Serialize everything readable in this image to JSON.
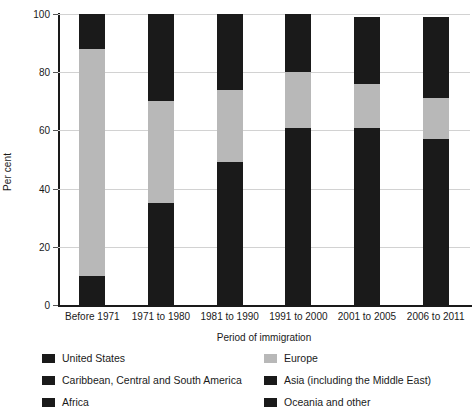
{
  "chart_data": {
    "type": "bar",
    "subtype": "stacked-percentage-column",
    "title": "",
    "xlabel": "Period of immigration",
    "ylabel": "Per cent",
    "ylim": [
      0,
      100
    ],
    "yticks": [
      0,
      20,
      40,
      60,
      80,
      100
    ],
    "grid": true,
    "legend_position": "bottom",
    "categories": [
      "Before 1971",
      "1971 to 1980",
      "1981 to 1990",
      "1991 to 2000",
      "2001 to 2005",
      "2006 to 2011"
    ],
    "series": [
      {
        "name": "United States",
        "color": "#1a1a1a",
        "values": [
          4,
          5,
          4,
          3,
          3,
          3
        ]
      },
      {
        "name": "Caribbean, Central and South America",
        "color": "#1a1a1a",
        "values": [
          6,
          30,
          45,
          58,
          58,
          54
        ]
      },
      {
        "name": "Europe",
        "color": "#b8b8b8",
        "values": [
          78,
          35,
          25,
          19,
          15,
          14
        ]
      },
      {
        "name": "Asia (including the Middle East)",
        "color": "#1a1a1a",
        "values": [
          12,
          30,
          26,
          20,
          23,
          28
        ]
      },
      {
        "name": "Africa",
        "color": "#1a1a1a",
        "values": [
          0,
          0,
          0,
          0,
          0,
          0
        ]
      },
      {
        "name": "Oceania and other",
        "color": "#1a1a1a",
        "values": [
          0,
          0,
          0,
          0,
          0,
          0
        ]
      }
    ],
    "rendered_segments": [
      {
        "category": "Before 1971",
        "segments": [
          {
            "from": 0,
            "to": 10,
            "color": "#1a1a1a"
          },
          {
            "from": 10,
            "to": 88,
            "color": "#b8b8b8"
          },
          {
            "from": 88,
            "to": 100,
            "color": "#1a1a1a"
          }
        ]
      },
      {
        "category": "1971 to 1980",
        "segments": [
          {
            "from": 0,
            "to": 35,
            "color": "#1a1a1a"
          },
          {
            "from": 35,
            "to": 70,
            "color": "#b8b8b8"
          },
          {
            "from": 70,
            "to": 100,
            "color": "#1a1a1a"
          }
        ]
      },
      {
        "category": "1981 to 1990",
        "segments": [
          {
            "from": 0,
            "to": 49,
            "color": "#1a1a1a"
          },
          {
            "from": 49,
            "to": 74,
            "color": "#b8b8b8"
          },
          {
            "from": 74,
            "to": 100,
            "color": "#1a1a1a"
          }
        ]
      },
      {
        "category": "1991 to 2000",
        "segments": [
          {
            "from": 0,
            "to": 61,
            "color": "#1a1a1a"
          },
          {
            "from": 61,
            "to": 80,
            "color": "#b8b8b8"
          },
          {
            "from": 80,
            "to": 100,
            "color": "#1a1a1a"
          }
        ]
      },
      {
        "category": "2001 to 2005",
        "segments": [
          {
            "from": 0,
            "to": 61,
            "color": "#1a1a1a"
          },
          {
            "from": 61,
            "to": 76,
            "color": "#b8b8b8"
          },
          {
            "from": 76,
            "to": 99,
            "color": "#1a1a1a"
          }
        ]
      },
      {
        "category": "2006 to 2011",
        "segments": [
          {
            "from": 0,
            "to": 57,
            "color": "#1a1a1a"
          },
          {
            "from": 57,
            "to": 71,
            "color": "#b8b8b8"
          },
          {
            "from": 71,
            "to": 99,
            "color": "#1a1a1a"
          }
        ]
      }
    ],
    "legend": [
      {
        "label": "United States",
        "color": "#1a1a1a",
        "column": "left",
        "row": 0
      },
      {
        "label": "Caribbean, Central and South America",
        "color": "#1a1a1a",
        "column": "left",
        "row": 1
      },
      {
        "label": "Africa",
        "color": "#1a1a1a",
        "column": "left",
        "row": 2
      },
      {
        "label": "Europe",
        "color": "#b8b8b8",
        "column": "right",
        "row": 0
      },
      {
        "label": "Asia (including the Middle East)",
        "color": "#1a1a1a",
        "column": "right",
        "row": 1
      },
      {
        "label": "Oceania and other",
        "color": "#1a1a1a",
        "column": "right",
        "row": 2
      }
    ]
  },
  "axis": {
    "y_title": "Per cent",
    "x_title": "Period of immigration",
    "y_tick_labels": [
      "0",
      "20",
      "40",
      "60",
      "80",
      "100"
    ]
  }
}
